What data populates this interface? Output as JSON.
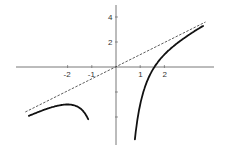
{
  "chart_data": {
    "type": "line",
    "title": "",
    "xlabel": "",
    "ylabel": "",
    "xlim": [
      -4.2,
      4.1
    ],
    "ylim": [
      -5.8,
      5.2
    ],
    "grid": false,
    "legend": null,
    "x_ticks": [
      {
        "value": -2,
        "label": "-2"
      },
      {
        "value": -1,
        "label": "-1"
      },
      {
        "value": 1,
        "label": "1"
      },
      {
        "value": 2,
        "label": "2"
      }
    ],
    "y_ticks": [
      {
        "value": 4,
        "label": "4"
      },
      {
        "value": 2,
        "label": "2"
      },
      {
        "value": -2,
        "label": ""
      },
      {
        "value": -4,
        "label": ""
      }
    ],
    "series": [
      {
        "name": "f(x) = x - 4/x^2 (left branch)",
        "style": "solid",
        "color": "#111111",
        "x": [
          -3.6,
          -3.2,
          -2.8,
          -2.4,
          -2.0,
          -1.7,
          -1.5,
          -1.35,
          -1.25,
          -1.15
        ],
        "values": [
          -3.91,
          -3.59,
          -3.31,
          -3.09,
          -3.0,
          -3.08,
          -3.28,
          -3.54,
          -3.81,
          -4.17
        ]
      },
      {
        "name": "f(x) = x - 4/x^2 (right branch)",
        "style": "solid",
        "color": "#111111",
        "x": [
          0.78,
          0.85,
          0.95,
          1.1,
          1.3,
          1.59,
          2.0,
          2.5,
          3.0,
          3.6
        ],
        "values": [
          -5.8,
          -4.69,
          -3.48,
          -2.21,
          -1.07,
          0.0,
          1.0,
          1.86,
          2.56,
          3.29
        ]
      },
      {
        "name": "asymptote y = x",
        "style": "dashed",
        "color": "#333333",
        "x": [
          -3.75,
          3.7
        ],
        "values": [
          -3.6,
          3.6
        ]
      }
    ]
  }
}
